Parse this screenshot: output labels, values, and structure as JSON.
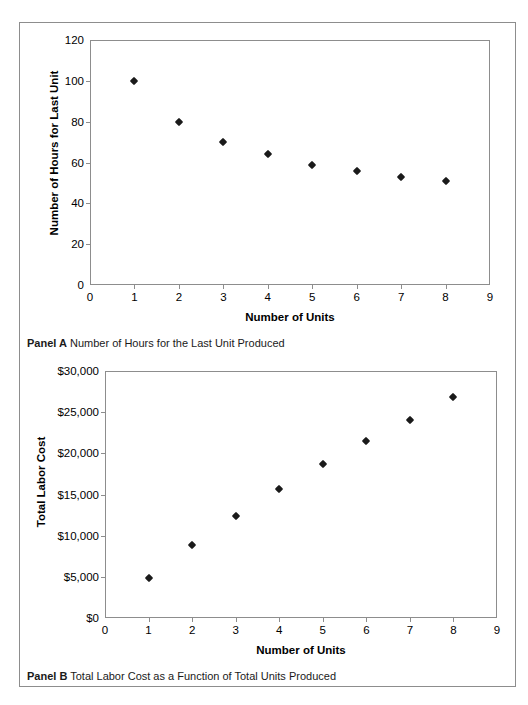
{
  "figure": {
    "panels": [
      {
        "id": "panel-a",
        "caption_label": "Panel A",
        "caption_text": "Number of Hours for the Last Unit Produced"
      },
      {
        "id": "panel-b",
        "caption_label": "Panel B",
        "caption_text": "Total Labor Cost as a Function of Total Units Produced"
      }
    ],
    "frame_color": "#8d8d8d",
    "marker_color": "#1a1a1a"
  },
  "chart_data": [
    {
      "type": "scatter",
      "title": "Number of Hours for the Last Unit Produced",
      "panel": "Panel A",
      "xlabel": "Number of Units",
      "ylabel": "Number of Hours for Last Unit",
      "x": [
        1,
        2,
        3,
        4,
        5,
        6,
        7,
        8
      ],
      "values": [
        100,
        80,
        70,
        64,
        59,
        56,
        53,
        51
      ],
      "xlim": [
        0,
        9
      ],
      "ylim": [
        0,
        120
      ],
      "xticks": [
        "0",
        "1",
        "2",
        "3",
        "4",
        "5",
        "6",
        "7",
        "8",
        "9"
      ],
      "xtick_values": [
        0,
        1,
        2,
        3,
        4,
        5,
        6,
        7,
        8,
        9
      ],
      "yticks": [
        "0",
        "20",
        "40",
        "60",
        "80",
        "100",
        "120"
      ],
      "ytick_values": [
        0,
        20,
        40,
        60,
        80,
        100,
        120
      ],
      "grid": false,
      "legend": "none"
    },
    {
      "type": "scatter",
      "title": "Total Labor Cost as a Function of Total Units Produced",
      "panel": "Panel B",
      "xlabel": "Number of Units",
      "ylabel": "Total Labor Cost",
      "x": [
        1,
        2,
        3,
        4,
        5,
        6,
        7,
        8
      ],
      "values": [
        4900,
        8900,
        12400,
        15700,
        18700,
        21500,
        24100,
        26800
      ],
      "xlim": [
        0,
        9
      ],
      "ylim": [
        0,
        30000
      ],
      "xticks": [
        "0",
        "1",
        "2",
        "3",
        "4",
        "5",
        "6",
        "7",
        "8",
        "9"
      ],
      "xtick_values": [
        0,
        1,
        2,
        3,
        4,
        5,
        6,
        7,
        8,
        9
      ],
      "yticks": [
        "$0",
        "$5,000",
        "$10,000",
        "$15,000",
        "$20,000",
        "$25,000",
        "$30,000"
      ],
      "ytick_values": [
        0,
        5000,
        10000,
        15000,
        20000,
        25000,
        30000
      ],
      "grid": false,
      "legend": "none"
    }
  ]
}
